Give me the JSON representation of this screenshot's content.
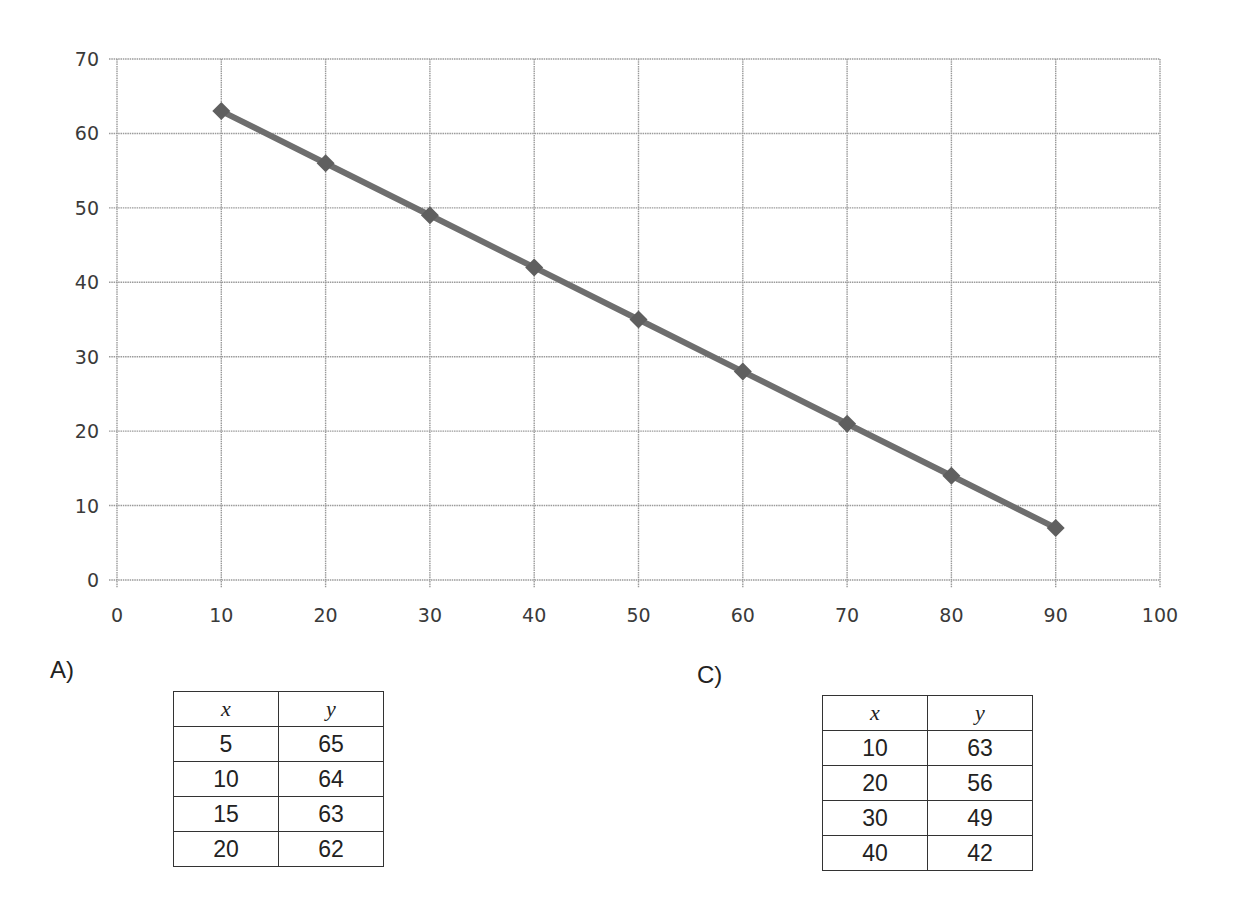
{
  "chart_data": {
    "type": "line",
    "title": "",
    "xlabel": "",
    "ylabel": "",
    "xlim": [
      0,
      100
    ],
    "ylim": [
      0,
      70
    ],
    "x_ticks": [
      0,
      10,
      20,
      30,
      40,
      50,
      60,
      70,
      80,
      90,
      100
    ],
    "y_ticks": [
      0,
      10,
      20,
      30,
      40,
      50,
      60,
      70
    ],
    "grid": true,
    "legend": null,
    "marker": "diamond",
    "series": [
      {
        "name": "line",
        "x": [
          10,
          20,
          30,
          40,
          50,
          60,
          70,
          80,
          90
        ],
        "y": [
          63,
          56,
          49,
          42,
          35,
          28,
          21,
          14,
          7
        ],
        "color": "#6e6e6e"
      }
    ]
  },
  "options": {
    "a": {
      "label": "A)",
      "headers": [
        "x",
        "y"
      ],
      "rows": [
        [
          "5",
          "65"
        ],
        [
          "10",
          "64"
        ],
        [
          "15",
          "63"
        ],
        [
          "20",
          "62"
        ]
      ]
    },
    "c": {
      "label": "C)",
      "headers": [
        "x",
        "y"
      ],
      "rows": [
        [
          "10",
          "63"
        ],
        [
          "20",
          "56"
        ],
        [
          "30",
          "49"
        ],
        [
          "40",
          "42"
        ]
      ]
    }
  },
  "colors": {
    "grid": "#9a9a9a",
    "line": "#6e6e6e",
    "marker": "#5f5f5f"
  }
}
